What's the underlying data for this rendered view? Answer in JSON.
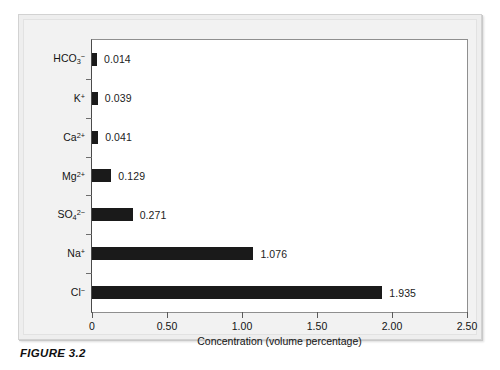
{
  "figure": {
    "caption": "FIGURE 3.2"
  },
  "chart_data": {
    "type": "bar",
    "orientation": "horizontal",
    "title": "",
    "xlabel": "Concentration (volume percentage)",
    "ylabel": "",
    "xlim": [
      0,
      2.5
    ],
    "xticks": [
      "0",
      "0.50",
      "1.00",
      "1.50",
      "2.00",
      "2.50"
    ],
    "xtick_values": [
      0,
      0.5,
      1.0,
      1.5,
      2.0,
      2.5
    ],
    "grid": false,
    "legend": "none",
    "bar_color": "#1a1a1a",
    "plot_background": "#ffffff",
    "panel_background": "#eeeeee",
    "categories": [
      {
        "html": "HCO<sub>3</sub><sup>−</sup>",
        "text": "HCO3-"
      },
      {
        "html": "K<sup>+</sup>",
        "text": "K+"
      },
      {
        "html": "Ca<sup>2+</sup>",
        "text": "Ca2+"
      },
      {
        "html": "Mg<sup>2+</sup>",
        "text": "Mg2+"
      },
      {
        "html": "SO<sub>4</sub><sup>2−</sup>",
        "text": "SO42-"
      },
      {
        "html": "Na<sup>+</sup>",
        "text": "Na+"
      },
      {
        "html": "Cl<sup>−</sup>",
        "text": "Cl-"
      }
    ],
    "values": [
      0.014,
      0.039,
      0.041,
      0.129,
      0.271,
      1.076,
      1.935
    ],
    "value_labels": [
      "0.014",
      "0.039",
      "0.041",
      "0.129",
      "0.271",
      "1.076",
      "1.935"
    ]
  }
}
